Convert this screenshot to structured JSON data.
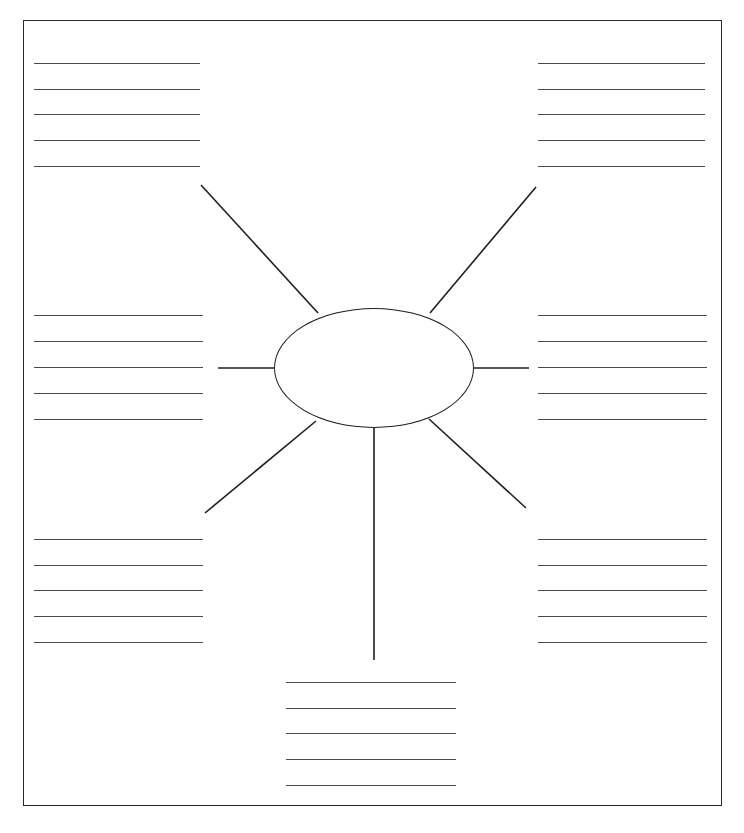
{
  "document": {
    "type": "spider-diagram-worksheet",
    "title": "",
    "page_width": 744,
    "page_height": 833,
    "background_color": "#ffffff",
    "ink_color": "#1f1f1f",
    "rule_color": "#4a4a4a"
  },
  "border": {
    "x": 23,
    "y": 20,
    "width": 699,
    "height": 786,
    "stroke_width": 1.5,
    "color": "#2b2b2b"
  },
  "center_node": {
    "label": "",
    "shape": "ellipse",
    "cx": 374,
    "cy": 368,
    "rx": 100,
    "ry": 60,
    "stroke_width": 1.6,
    "color": "#1f1f1f",
    "fill": "none"
  },
  "spokes": [
    {
      "name": "spoke-up-left",
      "x1": 318,
      "y1": 313,
      "x2": 201,
      "y2": 185
    },
    {
      "name": "spoke-up-right",
      "x1": 430,
      "y1": 313,
      "x2": 536,
      "y2": 187
    },
    {
      "name": "spoke-left",
      "x1": 274,
      "y1": 368,
      "x2": 218,
      "y2": 368
    },
    {
      "name": "spoke-right",
      "x1": 474,
      "y1": 368,
      "x2": 529,
      "y2": 368
    },
    {
      "name": "spoke-down-left",
      "x1": 316,
      "y1": 421,
      "x2": 205,
      "y2": 513
    },
    {
      "name": "spoke-down-right",
      "x1": 429,
      "y1": 419,
      "x2": 526,
      "y2": 508
    },
    {
      "name": "spoke-down",
      "x1": 374,
      "y1": 428,
      "x2": 374,
      "y2": 660
    }
  ],
  "answer_blocks": [
    {
      "name": "answer-block-top-left",
      "position": "top-left",
      "x": 34,
      "y": 63,
      "line_width": 166,
      "line_spacing": 25.7,
      "lines": [
        "",
        "",
        "",
        "",
        ""
      ]
    },
    {
      "name": "answer-block-top-right",
      "position": "top-right",
      "x": 538,
      "y": 63,
      "line_width": 167,
      "line_spacing": 25.7,
      "lines": [
        "",
        "",
        "",
        "",
        ""
      ]
    },
    {
      "name": "answer-block-middle-left",
      "position": "middle-left",
      "x": 34,
      "y": 315,
      "line_width": 169,
      "line_spacing": 26,
      "lines": [
        "",
        "",
        "",
        "",
        ""
      ]
    },
    {
      "name": "answer-block-middle-right",
      "position": "middle-right",
      "x": 538,
      "y": 315,
      "line_width": 169,
      "line_spacing": 26,
      "lines": [
        "",
        "",
        "",
        "",
        ""
      ]
    },
    {
      "name": "answer-block-bottom-left",
      "position": "bottom-left",
      "x": 34,
      "y": 539,
      "line_width": 169,
      "line_spacing": 25.7,
      "lines": [
        "",
        "",
        "",
        "",
        ""
      ]
    },
    {
      "name": "answer-block-bottom-right",
      "position": "bottom-right",
      "x": 538,
      "y": 539,
      "line_width": 169,
      "line_spacing": 25.7,
      "lines": [
        "",
        "",
        "",
        "",
        ""
      ]
    },
    {
      "name": "answer-block-bottom-center",
      "position": "bottom-center",
      "x": 286,
      "y": 682,
      "line_width": 170,
      "line_spacing": 25.7,
      "lines": [
        "",
        "",
        "",
        "",
        ""
      ]
    }
  ]
}
